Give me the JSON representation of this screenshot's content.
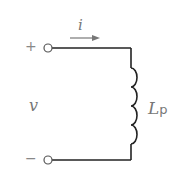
{
  "diagram": {
    "type": "circuit",
    "current_label": "i",
    "voltage_label": "v",
    "plus_sign": "+",
    "minus_sign": "−",
    "inductor_label": "L",
    "inductor_subscript": "p",
    "colors": {
      "wire": "#222222",
      "text": "#777777",
      "arrow": "#777777"
    }
  }
}
